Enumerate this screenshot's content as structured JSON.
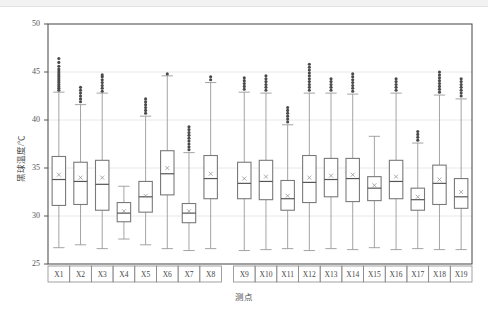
{
  "chart_data": {
    "type": "box",
    "title": "",
    "xlabel": "测点",
    "ylabel": "黑球温度/℃",
    "ylim": [
      25,
      50
    ],
    "yticks": [
      25,
      30,
      35,
      40,
      45,
      50
    ],
    "grid": true,
    "grid_axis": "y",
    "legend": "none",
    "categories": [
      "X1",
      "X2",
      "X3",
      "X4",
      "X5",
      "X6",
      "X7",
      "X8",
      "X9",
      "X10",
      "X11",
      "X12",
      "X13",
      "X14",
      "X15",
      "X16",
      "X17",
      "X18",
      "X19"
    ],
    "mean_marker": "x",
    "boxes": [
      {
        "label": "X1",
        "whisker_low": 26.7,
        "q1": 31.1,
        "median": 33.8,
        "mean": 34.3,
        "q3": 36.2,
        "whisker_high": 42.9,
        "outliers": [
          43.1,
          43.3,
          43.5,
          43.7,
          43.9,
          44.1,
          44.3,
          44.5,
          44.7,
          44.9,
          45.1,
          45.3,
          45.6,
          46.0,
          46.4
        ]
      },
      {
        "label": "X2",
        "whisker_low": 27.0,
        "q1": 31.2,
        "median": 33.6,
        "mean": 34.0,
        "q3": 35.6,
        "whisker_high": 41.6,
        "outliers": [
          41.9,
          42.2,
          42.5,
          42.8,
          43.1,
          43.4
        ]
      },
      {
        "label": "X3",
        "whisker_low": 26.6,
        "q1": 30.6,
        "median": 33.3,
        "mean": 34.0,
        "q3": 35.8,
        "whisker_high": 42.8,
        "outliers": [
          43.0,
          43.3,
          43.6,
          43.9,
          44.2,
          44.5,
          44.7
        ]
      },
      {
        "label": "X4",
        "whisker_low": 27.6,
        "q1": 29.4,
        "median": 30.3,
        "mean": 30.5,
        "q3": 31.4,
        "whisker_high": 33.1,
        "outliers": []
      },
      {
        "label": "X5",
        "whisker_low": 27.0,
        "q1": 30.4,
        "median": 32.0,
        "mean": 32.1,
        "q3": 33.6,
        "whisker_high": 40.4,
        "outliers": [
          40.7,
          41.0,
          41.3,
          41.6,
          41.9,
          42.2
        ]
      },
      {
        "label": "X6",
        "whisker_low": 26.6,
        "q1": 32.2,
        "median": 34.4,
        "mean": 35.0,
        "q3": 36.8,
        "whisker_high": 44.6,
        "outliers": [
          44.8
        ]
      },
      {
        "label": "X7",
        "whisker_low": 26.4,
        "q1": 29.3,
        "median": 30.3,
        "mean": 30.5,
        "q3": 31.3,
        "whisker_high": 36.6,
        "outliers": [
          36.9,
          37.2,
          37.5,
          37.8,
          38.1,
          38.4,
          38.7,
          39.0,
          39.3
        ]
      },
      {
        "label": "X8",
        "whisker_low": 26.6,
        "q1": 31.8,
        "median": 33.9,
        "mean": 34.4,
        "q3": 36.3,
        "whisker_high": 43.9,
        "outliers": [
          44.2,
          44.5
        ]
      },
      {
        "label": "X9",
        "whisker_low": 26.4,
        "q1": 31.8,
        "median": 33.4,
        "mean": 33.9,
        "q3": 35.6,
        "whisker_high": 42.9,
        "outliers": [
          43.2,
          43.5,
          43.8,
          44.1,
          44.4
        ]
      },
      {
        "label": "X10",
        "whisker_low": 26.5,
        "q1": 31.7,
        "median": 33.6,
        "mean": 34.1,
        "q3": 35.8,
        "whisker_high": 42.8,
        "outliers": [
          43.1,
          43.4,
          43.7,
          44.0,
          44.3,
          44.6
        ]
      },
      {
        "label": "X11",
        "whisker_low": 26.6,
        "q1": 30.6,
        "median": 31.8,
        "mean": 32.1,
        "q3": 33.7,
        "whisker_high": 39.5,
        "outliers": [
          39.8,
          40.1,
          40.4,
          40.7,
          41.0,
          41.3
        ]
      },
      {
        "label": "X12",
        "whisker_low": 26.4,
        "q1": 31.4,
        "median": 33.5,
        "mean": 34.0,
        "q3": 36.3,
        "whisker_high": 42.8,
        "outliers": [
          43.1,
          43.4,
          43.7,
          44.0,
          44.3,
          44.6,
          44.9,
          45.2,
          45.5,
          45.8
        ]
      },
      {
        "label": "X13",
        "whisker_low": 26.6,
        "q1": 32.0,
        "median": 33.8,
        "mean": 34.2,
        "q3": 36.0,
        "whisker_high": 42.8,
        "outliers": [
          43.1,
          43.4,
          43.7,
          44.0,
          44.3
        ]
      },
      {
        "label": "X14",
        "whisker_low": 26.5,
        "q1": 31.5,
        "median": 33.9,
        "mean": 34.3,
        "q3": 36.0,
        "whisker_high": 42.7,
        "outliers": [
          43.0,
          43.3,
          43.6,
          43.9,
          44.2,
          44.5,
          44.8
        ]
      },
      {
        "label": "X15",
        "whisker_low": 26.7,
        "q1": 31.6,
        "median": 32.9,
        "mean": 33.2,
        "q3": 34.1,
        "whisker_high": 38.3,
        "outliers": []
      },
      {
        "label": "X16",
        "whisker_low": 26.5,
        "q1": 31.8,
        "median": 33.6,
        "mean": 34.1,
        "q3": 35.8,
        "whisker_high": 42.8,
        "outliers": [
          43.1,
          43.4,
          43.7,
          44.0,
          44.3
        ]
      },
      {
        "label": "X17",
        "whisker_low": 26.6,
        "q1": 30.6,
        "median": 31.7,
        "mean": 32.0,
        "q3": 32.9,
        "whisker_high": 37.6,
        "outliers": [
          37.9,
          38.2,
          38.5,
          38.8
        ]
      },
      {
        "label": "X18",
        "whisker_low": 26.5,
        "q1": 31.2,
        "median": 33.4,
        "mean": 33.8,
        "q3": 35.3,
        "whisker_high": 42.6,
        "outliers": [
          42.9,
          43.2,
          43.5,
          43.8,
          44.1,
          44.4,
          44.7,
          45.0
        ]
      },
      {
        "label": "X19",
        "whisker_low": 26.5,
        "q1": 30.8,
        "median": 32.0,
        "mean": 32.5,
        "q3": 33.9,
        "whisker_high": 42.2,
        "outliers": [
          42.5,
          42.8,
          43.1,
          43.4,
          43.7,
          44.0,
          44.3
        ]
      }
    ],
    "group_gap_after": "X8",
    "colors": {
      "box_edge": "#7a7a7a",
      "median": "#555555",
      "whisker": "#9a9a9a",
      "outlier": "#4a4a4a",
      "grid": "#e8e8e8",
      "frame": "#555555",
      "background": "#ffffff"
    }
  }
}
